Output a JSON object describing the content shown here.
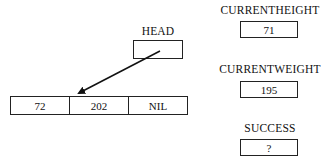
{
  "head": {
    "label": "HEAD",
    "value": ""
  },
  "list": {
    "cells": [
      "72",
      "202",
      "NIL"
    ]
  },
  "variables": [
    {
      "label": "CURRENTHEIGHT",
      "value": "71"
    },
    {
      "label": "CURRENTWEIGHT",
      "value": "195"
    },
    {
      "label": "SUCCESS",
      "value": "?"
    }
  ],
  "pointer": {
    "from": "HEAD",
    "to": "list.cells.0"
  }
}
